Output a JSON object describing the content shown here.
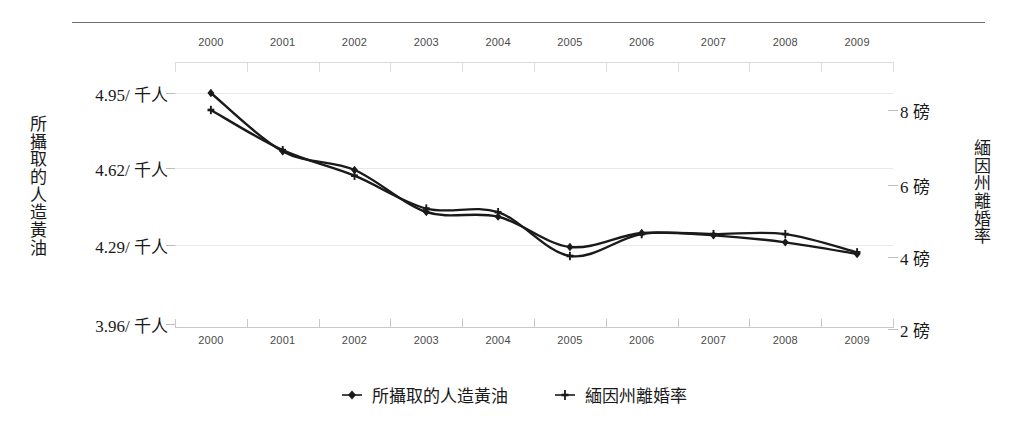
{
  "chart_data": {
    "type": "line",
    "title": "",
    "xlabel": "",
    "categories": [
      "2000",
      "2001",
      "2002",
      "2003",
      "2004",
      "2005",
      "2006",
      "2007",
      "2008",
      "2009"
    ],
    "x_axis_top_labels": [
      "2000",
      "2001",
      "2002",
      "2003",
      "2004",
      "2005",
      "2006",
      "2007",
      "2008",
      "2009"
    ],
    "x_axis_bottom_labels": [
      "2000",
      "2001",
      "2002",
      "2003",
      "2004",
      "2005",
      "2006",
      "2007",
      "2008",
      "2009"
    ],
    "grid": true,
    "legend_position": "bottom",
    "left_axis": {
      "label": "所攝取的人造黃油",
      "unit": "/ 千人",
      "tick_labels": [
        "4.95/ 千人",
        "4.62/ 千人",
        "4.29/ 千人",
        "3.96/ 千人"
      ],
      "tick_values": [
        4.95,
        4.62,
        4.29,
        3.96
      ],
      "ylim": [
        3.96,
        4.95
      ]
    },
    "right_axis": {
      "label": "緬因州離婚率",
      "unit": "磅",
      "tick_labels": [
        "8 磅",
        "6 磅",
        "4 磅",
        "2 磅"
      ],
      "tick_values": [
        8,
        6,
        4,
        2
      ],
      "ylim": [
        2,
        8
      ]
    },
    "series": [
      {
        "name": "所攝取的人造黃油",
        "axis": "left",
        "marker": "filled-diamond",
        "color": "#1a1a1a",
        "values": [
          4.95,
          4.7,
          4.62,
          4.44,
          4.42,
          4.29,
          4.35,
          4.34,
          4.31,
          4.26
        ]
      },
      {
        "name": "緬因州離婚率",
        "axis": "right",
        "marker": "cross",
        "color": "#1a1a1a",
        "values": [
          8.0,
          6.9,
          6.2,
          5.3,
          5.2,
          4.0,
          4.6,
          4.6,
          4.6,
          4.1
        ]
      }
    ]
  },
  "legend": {
    "items": [
      {
        "label": "所攝取的人造黃油",
        "marker": "filled-diamond"
      },
      {
        "label": "緬因州離婚率",
        "marker": "cross"
      }
    ]
  },
  "colors": {
    "series": "#1a1a1a",
    "grid": "#e9e9e9",
    "rule": "#6e6e6e",
    "tick": "#bdbdbd"
  }
}
